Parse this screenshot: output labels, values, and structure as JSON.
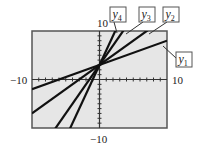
{
  "chart_data": {
    "type": "line",
    "title": "",
    "xlabel": "",
    "ylabel": "",
    "xlim": [
      -10,
      10
    ],
    "ylim": [
      -10,
      10
    ],
    "grid": false,
    "tick_labels": {
      "x_min": "−10",
      "x_max": "10",
      "y_min": "−10",
      "y_max": "10"
    },
    "series": [
      {
        "name": "y1",
        "label": "y",
        "subscript": "1",
        "slope": 0.5,
        "intercept": 3
      },
      {
        "name": "y2",
        "label": "y",
        "subscript": "2",
        "slope": 1,
        "intercept": 3
      },
      {
        "name": "y3",
        "label": "y",
        "subscript": "3",
        "slope": 2,
        "intercept": 3
      },
      {
        "name": "y4",
        "label": "y",
        "subscript": "4",
        "slope": 3,
        "intercept": 3
      }
    ],
    "colors": {
      "plot_background": "#e6e6e6",
      "line": "#111111",
      "frame": "#555555"
    },
    "legend_position": "callout-labels"
  }
}
